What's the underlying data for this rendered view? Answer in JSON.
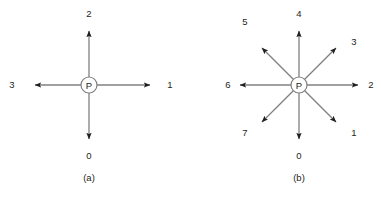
{
  "figure": {
    "background_color": "#ffffff",
    "line_color": "#808080",
    "arrowhead_color": "#231f20",
    "text_color": "#231f20",
    "node_stroke_color": "#808080"
  },
  "panels": [
    {
      "id": "a",
      "caption": "(a)",
      "center": {
        "x": 89,
        "y": 85,
        "radius": 8,
        "label": "P"
      },
      "arrow_count": 4,
      "arrow_length": 61,
      "arrows": [
        {
          "label": "1",
          "angle_deg": 0,
          "dx": 61,
          "dy": 0,
          "label_x": 170,
          "label_y": 85
        },
        {
          "label": "2",
          "angle_deg": 90,
          "dx": 0,
          "dy": -57,
          "label_x": 89,
          "label_y": 14
        },
        {
          "label": "3",
          "angle_deg": 180,
          "dx": -61,
          "dy": 0,
          "label_x": 12,
          "label_y": 85
        },
        {
          "label": "0",
          "angle_deg": 270,
          "dx": 0,
          "dy": 57,
          "label_x": 89,
          "label_y": 156
        }
      ]
    },
    {
      "id": "b",
      "caption": "(b)",
      "center": {
        "x": 299,
        "y": 85,
        "radius": 8,
        "label": "P"
      },
      "arrow_count": 8,
      "arrow_length": 61,
      "arrows": [
        {
          "label": "2",
          "angle_deg": 0,
          "dx": 61,
          "dy": 0,
          "label_x": 371,
          "label_y": 85
        },
        {
          "label": "3",
          "angle_deg": 45,
          "dx": 41,
          "dy": -41,
          "label_x": 354,
          "label_y": 42
        },
        {
          "label": "4",
          "angle_deg": 90,
          "dx": 0,
          "dy": -57,
          "label_x": 299,
          "label_y": 14
        },
        {
          "label": "5",
          "angle_deg": 135,
          "dx": -41,
          "dy": -41,
          "label_x": 245,
          "label_y": 22
        },
        {
          "label": "6",
          "angle_deg": 180,
          "dx": -61,
          "dy": 0,
          "label_x": 228,
          "label_y": 85
        },
        {
          "label": "7",
          "angle_deg": 225,
          "dx": -41,
          "dy": 41,
          "label_x": 245,
          "label_y": 133
        },
        {
          "label": "0",
          "angle_deg": 270,
          "dx": 0,
          "dy": 57,
          "label_x": 299,
          "label_y": 156
        },
        {
          "label": "1",
          "angle_deg": 315,
          "dx": 41,
          "dy": 41,
          "label_x": 354,
          "label_y": 133
        }
      ]
    }
  ],
  "captions": {
    "a_position": {
      "x": 89,
      "y": 177
    },
    "b_position": {
      "x": 299,
      "y": 177
    }
  }
}
